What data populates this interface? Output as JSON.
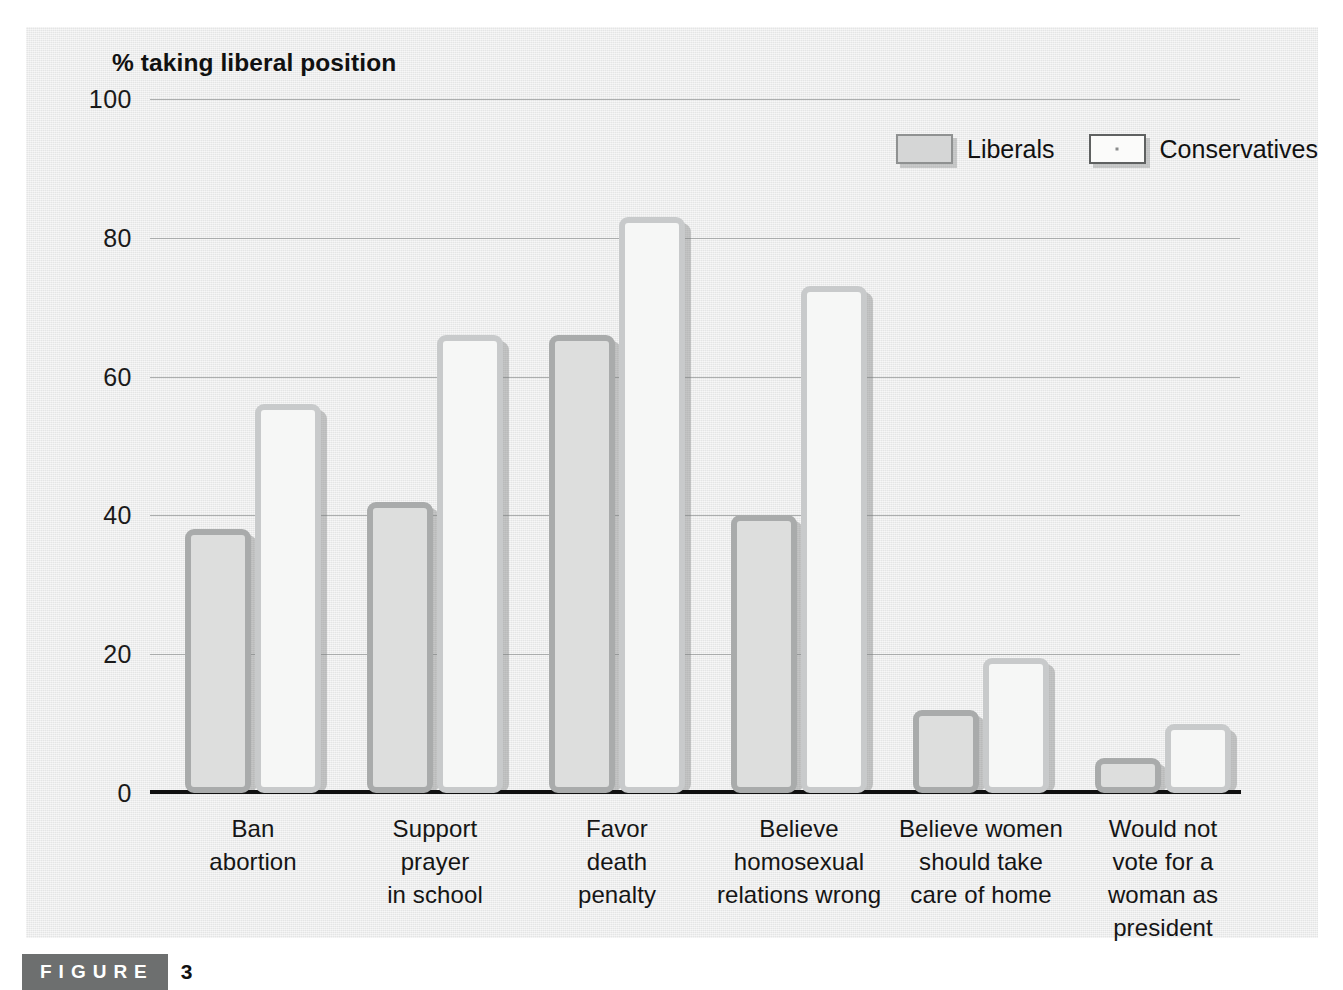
{
  "figure": {
    "tag_label": "FIGURE",
    "number": "3"
  },
  "chart_data": {
    "type": "bar",
    "title": "% taking liberal position",
    "xlabel": "",
    "ylabel": "% taking liberal position",
    "ylim": [
      0,
      100
    ],
    "yticks": [
      0,
      20,
      40,
      60,
      80,
      100
    ],
    "ytick_labels": [
      "0",
      "20",
      "40",
      "60",
      "80",
      "100"
    ],
    "grid": true,
    "legend_position": "top-right",
    "categories": [
      "Ban\nabortion",
      "Support\nprayer\nin school",
      "Favor\ndeath\npenalty",
      "Believe\nhomosexual\nrelations wrong",
      "Believe women\nshould take\ncare of home",
      "Would not\nvote for a\nwoman as\npresident"
    ],
    "category_lines": [
      [
        "Ban",
        "abortion"
      ],
      [
        "Support",
        "prayer",
        "in school"
      ],
      [
        "Favor",
        "death",
        "penalty"
      ],
      [
        "Believe",
        "homosexual",
        "relations wrong"
      ],
      [
        "Believe women",
        "should take",
        "care of home"
      ],
      [
        "Would not",
        "vote for a",
        "woman as",
        "president"
      ]
    ],
    "series": [
      {
        "name": "Liberals",
        "color": "#dddedd",
        "border_color": "#a9abab",
        "values": [
          38,
          42,
          66,
          40,
          12,
          5
        ]
      },
      {
        "name": "Conservatives",
        "color": "#f6f7f6",
        "border_color": "#c8cacb",
        "values": [
          56,
          66,
          83,
          73,
          19.5,
          10
        ]
      }
    ]
  },
  "colors": {
    "panel_background": "#e8e9e9",
    "page_background": "#ffffff",
    "axis": "#111111",
    "gridline": "#9fa1a1",
    "caption_tag_background": "#6d6f6f"
  }
}
